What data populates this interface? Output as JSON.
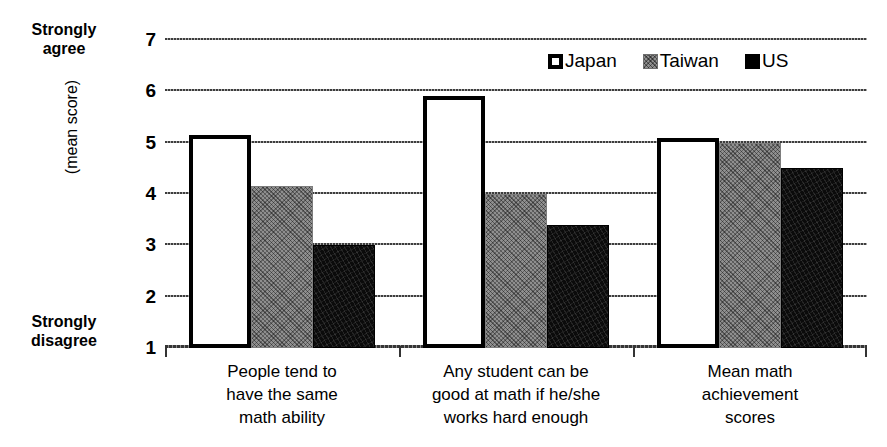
{
  "chart_data": {
    "type": "bar",
    "title": "",
    "subtitle": "",
    "xlabel": "",
    "ylabel": "(mean score)",
    "ylim": [
      1,
      7
    ],
    "y_ticks": [
      1,
      2,
      3,
      4,
      5,
      6,
      7
    ],
    "grid": true,
    "legend_position": "top-right",
    "axis_anchor_high": "Strongly agree",
    "axis_anchor_low": "Strongly disagree",
    "categories": [
      "People tend to have the same math ability",
      "Any student can be good at math if he/she works hard enough",
      "Mean math achievement scores"
    ],
    "series": [
      {
        "name": "Japan",
        "values": [
          5.15,
          5.9,
          5.1
        ]
      },
      {
        "name": "Taiwan",
        "values": [
          4.15,
          4.0,
          5.0
        ]
      },
      {
        "name": "US",
        "values": [
          3.0,
          3.4,
          4.5
        ]
      }
    ]
  },
  "axis": {
    "anchor_top": {
      "line1": "Strongly",
      "line2": "agree"
    },
    "anchor_bottom": {
      "line1": "Strongly",
      "line2": "disagree"
    },
    "y_title": "(mean score)",
    "ticks": [
      "7",
      "6",
      "5",
      "4",
      "3",
      "2",
      "1"
    ]
  },
  "legend": {
    "items": [
      {
        "label": "Japan",
        "swatch": "japan-swatch-icon"
      },
      {
        "label": "Taiwan",
        "swatch": "taiwan-swatch-icon"
      },
      {
        "label": "US",
        "swatch": "us-swatch-icon"
      }
    ]
  },
  "categories_wrapped": [
    {
      "line1": "People tend to",
      "line2": "have the same",
      "line3": "math ability"
    },
    {
      "line1": "Any student can be",
      "line2": "good at math if he/she",
      "line3": "works hard enough"
    },
    {
      "line1": "Mean math",
      "line2": "achievement",
      "line3": "scores"
    }
  ],
  "colors": {
    "japan": "#ffffff",
    "taiwan": "#8f8f8f",
    "us": "#000000",
    "axis": "#000000",
    "grid": "#333333"
  }
}
